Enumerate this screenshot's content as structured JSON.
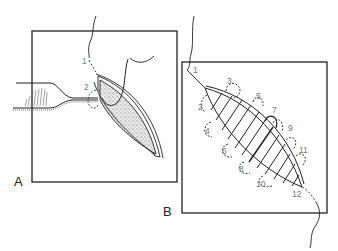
{
  "figure": {
    "panels": [
      {
        "id": "A",
        "label": "A",
        "stitch_labels": [
          "1",
          "2"
        ]
      },
      {
        "id": "B",
        "label": "B",
        "stitch_labels": [
          "1",
          "2",
          "3",
          "4",
          "5",
          "6",
          "7",
          "8",
          "9",
          "10",
          "11",
          "12"
        ]
      }
    ],
    "colors": {
      "line": "#222222",
      "label": "#777777",
      "background": "#ffffff"
    }
  }
}
